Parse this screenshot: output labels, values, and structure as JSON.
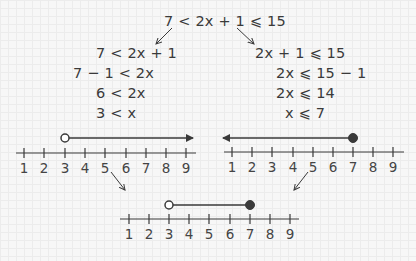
{
  "main_inequality": "7 < 2x + 1 ⩽ 15",
  "left_branch": {
    "steps": [
      "7 < 2x + 1",
      "7 − 1 < 2x",
      "6 < 2x",
      "3 < x"
    ],
    "number_line": {
      "ticks": [
        "1",
        "2",
        "3",
        "4",
        "5",
        "6",
        "7",
        "8",
        "9"
      ],
      "endpoint": 3,
      "endpoint_type": "open",
      "direction": "right"
    }
  },
  "right_branch": {
    "steps": [
      "2x + 1 ⩽ 15",
      "2x ⩽ 15 − 1",
      "2x ⩽ 14",
      "x ⩽ 7"
    ],
    "number_line": {
      "ticks": [
        "1",
        "2",
        "3",
        "4",
        "5",
        "6",
        "7",
        "8",
        "9"
      ],
      "endpoint": 7,
      "endpoint_type": "closed",
      "direction": "left"
    }
  },
  "combined": {
    "number_line": {
      "ticks": [
        "1",
        "2",
        "3",
        "4",
        "5",
        "6",
        "7",
        "8",
        "9"
      ],
      "start": 3,
      "start_type": "open",
      "end": 7,
      "end_type": "closed"
    }
  },
  "colors": {
    "ink": "#3a3a3a",
    "background": "#f7f7f7",
    "grid": "#ececec"
  }
}
